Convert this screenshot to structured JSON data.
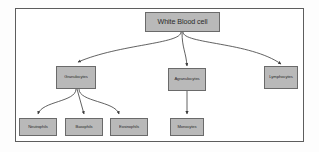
{
  "diagram": {
    "frame": {
      "stroke": "#5d5d5d",
      "background": "#ffffff"
    },
    "node_style": {
      "fill": "#b9b9b9",
      "stroke": "#6a6a6a",
      "text_color": "#2b2b2b"
    },
    "edge_style": {
      "stroke": "#3a3a3a",
      "arrowhead": "filled-triangle"
    },
    "nodes": [
      {
        "id": "wbc",
        "label": "White Blood cell",
        "level": 1
      },
      {
        "id": "granulocytes",
        "label": "Granulocytes",
        "level": 2
      },
      {
        "id": "agranulocytes",
        "label": "Agranulocytes",
        "level": 2
      },
      {
        "id": "lymphocytes",
        "label": "Lymphocytes",
        "level": 2
      },
      {
        "id": "neutrophils",
        "label": "Neutrophils",
        "level": 3
      },
      {
        "id": "basophils",
        "label": "Basophils",
        "level": 3
      },
      {
        "id": "eosinophils",
        "label": "Eosinophils",
        "level": 3
      },
      {
        "id": "monocytes",
        "label": "Monocytes",
        "level": 3
      }
    ],
    "edges": [
      {
        "from": "wbc",
        "to": "granulocytes"
      },
      {
        "from": "wbc",
        "to": "agranulocytes"
      },
      {
        "from": "wbc",
        "to": "lymphocytes"
      },
      {
        "from": "granulocytes",
        "to": "neutrophils"
      },
      {
        "from": "granulocytes",
        "to": "basophils"
      },
      {
        "from": "granulocytes",
        "to": "eosinophils"
      },
      {
        "from": "agranulocytes",
        "to": "monocytes"
      }
    ]
  }
}
